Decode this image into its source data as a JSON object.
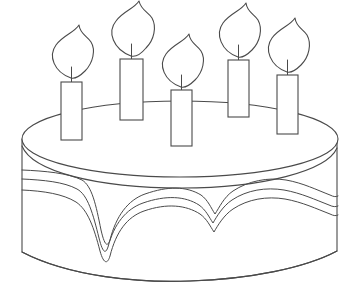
{
  "artwork": {
    "title": "Birthday Cake Coloring Page",
    "subject": "birthday-cake",
    "style": "black-and-white line art outline drawing",
    "background_color": "#ffffff",
    "line_color": "#4a4a4a",
    "line_width": 1.1,
    "canvas": {
      "width": 359,
      "height": 296
    }
  },
  "cake": {
    "name": "round layer cake",
    "top_surface": {
      "shape": "ellipse",
      "center_x": 180,
      "center_y": 139,
      "radius_x": 158,
      "radius_y": 38
    },
    "rim_highlight": {
      "description": "second inner ellipse arc below top rim forming cake edge thickness"
    },
    "side_wall": {
      "left_x": 22,
      "right_x": 338,
      "top_y": 139,
      "bottom_y": 258,
      "bottom_curve": "convex arc sagging to y=275 at center"
    },
    "frosting": {
      "line_count": 3,
      "description": "three parallel wavy drip contour lines running across the cake side",
      "drip_points": [
        {
          "x": 100,
          "depth": "deep",
          "label": "left-deep-drip"
        },
        {
          "x": 210,
          "depth": "medium",
          "label": "center-drip"
        },
        {
          "x": 300,
          "depth": "shallow",
          "label": "right-shallow-drip"
        }
      ]
    }
  },
  "candles": {
    "count": 5,
    "items": [
      {
        "id": 1,
        "label": "candle-one",
        "x": 61,
        "y": 82,
        "width": 21,
        "height": 58,
        "flame_tip_x": 88,
        "flame_tip_y": 36
      },
      {
        "id": 2,
        "label": "candle-two",
        "x": 120,
        "y": 59,
        "width": 23,
        "height": 61,
        "flame_tip_x": 148,
        "flame_tip_y": 15
      },
      {
        "id": 3,
        "label": "candle-three",
        "x": 171,
        "y": 90,
        "width": 21,
        "height": 56,
        "flame_tip_x": 196,
        "flame_tip_y": 46
      },
      {
        "id": 4,
        "label": "candle-four",
        "x": 228,
        "y": 60,
        "width": 21,
        "height": 57,
        "flame_tip_x": 255,
        "flame_tip_y": 17
      },
      {
        "id": 5,
        "label": "candle-five",
        "x": 277,
        "y": 75,
        "width": 21,
        "height": 59,
        "flame_tip_x": 303,
        "flame_tip_y": 32
      }
    ],
    "flame": {
      "shape": "teardrop leaf with pointed tip curving right",
      "filled": false
    },
    "wick": {
      "description": "short vertical line from candle top into flame base"
    }
  },
  "labels": {
    "canvas_label": "cake-drawing-canvas",
    "alt_text": "Outline drawing of a round birthday cake with dripping frosting and five lit candles"
  }
}
